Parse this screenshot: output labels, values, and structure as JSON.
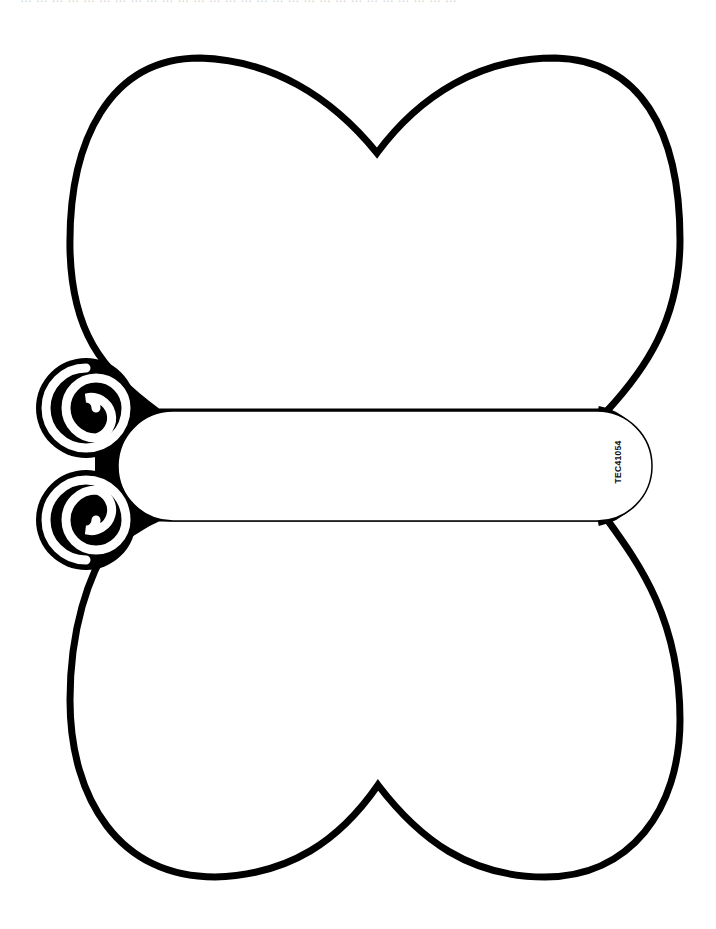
{
  "page": {
    "top_text_fragment": "… … … … … … … … … … … … … … … … … … … … … … … … … … … …",
    "product_code": "TEC41054"
  },
  "template": {
    "subject": "butterfly",
    "parts": [
      "upper-wing",
      "lower-wing",
      "body",
      "antenna-top",
      "antenna-bottom"
    ]
  },
  "colors": {
    "outline": "#000000",
    "fill": "#ffffff",
    "background": "#ffffff"
  }
}
